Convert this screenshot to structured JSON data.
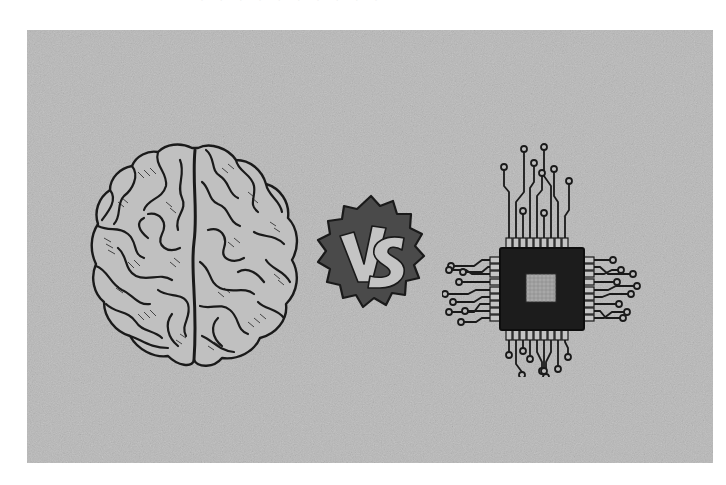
{
  "page": {
    "background_color": "#ffffff",
    "top_cut_text": "· · ·  · ·  · · ·  · ·"
  },
  "illustration": {
    "panel_color": "#b9b9b9",
    "ink_color": "#1a1a1a",
    "left_subject": {
      "name": "human brain",
      "style": "engraved line art, top view"
    },
    "center_badge": {
      "label": "VS",
      "badge_color": "#4a4a4a",
      "letter_color": "#c4c4c4"
    },
    "right_subject": {
      "name": "microchip",
      "style": "CPU with circuit traces",
      "body_color": "#1c1c1c",
      "die_color": "#a8a8a8"
    }
  }
}
